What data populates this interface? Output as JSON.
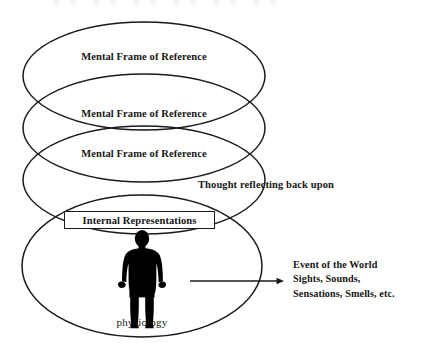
{
  "diagram": {
    "background_color": "#ffffff",
    "stroke_color": "#1a1a1a",
    "figure_color": "#000000",
    "frames": [
      {
        "label": "Mental Frame of Reference"
      },
      {
        "label": "Mental Frame of Reference"
      },
      {
        "label": "Mental Frame of Reference"
      }
    ],
    "internal_representations": {
      "label": "Internal Representations"
    },
    "thought_label": "Thought reflecting back upon",
    "physiology_label": "physiology",
    "event_block": {
      "lines": [
        "Event of the World",
        "Sights, Sounds,",
        "Sensations, Smells, etc."
      ]
    },
    "arrow": {
      "direction": "right",
      "from_x": 190,
      "to_x": 284,
      "y": 281
    },
    "ellipses": [
      {
        "cx": 144,
        "cy": 76,
        "rx": 121,
        "ry": 54
      },
      {
        "cx": 144,
        "cy": 128,
        "rx": 121,
        "ry": 54
      },
      {
        "cx": 144,
        "cy": 180,
        "rx": 121,
        "ry": 54
      },
      {
        "cx": 142,
        "cy": 266,
        "rx": 120,
        "ry": 71
      }
    ]
  }
}
